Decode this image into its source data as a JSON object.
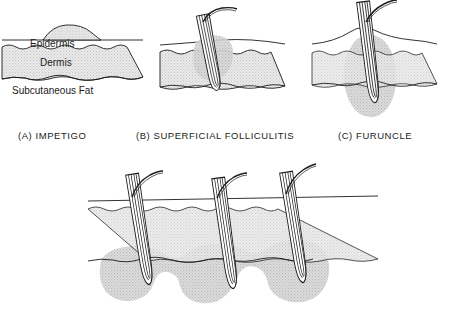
{
  "figure": {
    "background_color": "#ffffff",
    "ink_color": "#1c1c1c",
    "skin_band_color": "#e3e3e3",
    "lesion_fill_color": "#c9c9c9"
  },
  "layer_labels": {
    "epidermis": "Epidermis",
    "dermis": "Dermis",
    "subcutaneous_fat": "Subcutaneous Fat"
  },
  "panels": [
    {
      "id": "a",
      "caption": "(A)  IMPETIGO",
      "letter": "(A)",
      "name": "IMPETIGO",
      "depth": "epidermis",
      "lesion": "superficial blister/dome above the epidermis",
      "follicle_count": 0
    },
    {
      "id": "b",
      "caption": "(B)  SUPERFICIAL FOLLICULITIS",
      "letter": "(B)",
      "name": "SUPERFICIAL FOLLICULITIS",
      "depth": "upper follicle / epidermis-dermis",
      "lesion": "inflammation around the upper hair follicle",
      "follicle_count": 1
    },
    {
      "id": "c",
      "caption": "(C)  FURUNCLE",
      "letter": "(C)",
      "name": "FURUNCLE",
      "depth": "dermis into subcutaneous fat",
      "lesion": "single deep abscess surrounding the whole follicle",
      "follicle_count": 1
    },
    {
      "id": "d",
      "caption": "",
      "letter": "",
      "name": "CARBUNCLE",
      "depth": "subcutaneous fat",
      "lesion": "several coalescing deep abscesses spanning three follicles",
      "follicle_count": 3
    }
  ]
}
